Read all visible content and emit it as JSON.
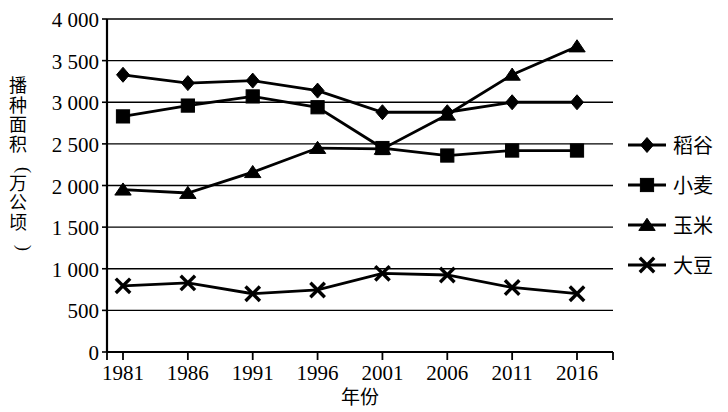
{
  "chart_data": {
    "type": "line",
    "title": "",
    "xlabel": "年份",
    "ylabel": "播种面积(万公顷)",
    "categories": [
      "1981",
      "1986",
      "1991",
      "1996",
      "2001",
      "2006",
      "2011",
      "2016"
    ],
    "xlim": [
      1981,
      2016
    ],
    "ylim": [
      0,
      4000
    ],
    "ytick_labels": [
      "4 000",
      "3 500",
      "3 000",
      "2 500",
      "2 000",
      "1 500",
      "1 000",
      "500",
      "0"
    ],
    "yticks": [
      4000,
      3500,
      3000,
      2500,
      2000,
      1500,
      1000,
      500,
      0
    ],
    "grid": true,
    "grid_axis": "y",
    "legend_position": "right",
    "series": [
      {
        "name": "稻谷",
        "marker": "diamond",
        "color": "#000000",
        "values": [
          3330,
          3230,
          3260,
          3140,
          2880,
          2880,
          3000,
          3000
        ]
      },
      {
        "name": "小麦",
        "marker": "square",
        "color": "#000000",
        "values": [
          2830,
          2960,
          3070,
          2940,
          2450,
          2360,
          2420,
          2420
        ]
      },
      {
        "name": "玉米",
        "marker": "triangle",
        "color": "#000000",
        "values": [
          1950,
          1910,
          2160,
          2450,
          2440,
          2850,
          3330,
          3670
        ]
      },
      {
        "name": "大豆",
        "marker": "cross",
        "color": "#000000",
        "values": [
          795,
          830,
          700,
          745,
          945,
          925,
          775,
          700
        ]
      }
    ]
  },
  "legend": {
    "items": [
      {
        "label": "稻谷"
      },
      {
        "label": "小麦"
      },
      {
        "label": "玉米"
      },
      {
        "label": "大豆"
      }
    ]
  },
  "axes": {
    "x_title": "年份",
    "y_title": "播种面积(万公顷)"
  }
}
